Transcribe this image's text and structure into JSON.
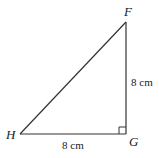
{
  "diagram": {
    "type": "right-triangle",
    "vertices": [
      {
        "id": "F",
        "label": "F",
        "x": 126,
        "y": 22
      },
      {
        "id": "G",
        "label": "G",
        "x": 126,
        "y": 134
      },
      {
        "id": "H",
        "label": "H",
        "x": 20,
        "y": 134
      }
    ],
    "right_angle_at": "G",
    "sides": [
      {
        "from": "F",
        "to": "G",
        "length_label": "8 cm"
      },
      {
        "from": "H",
        "to": "G",
        "length_label": "8 cm"
      },
      {
        "from": "H",
        "to": "F",
        "length_label": ""
      }
    ],
    "colors": {
      "stroke": "#333333",
      "text": "#222222",
      "background": "#ffffff"
    }
  }
}
